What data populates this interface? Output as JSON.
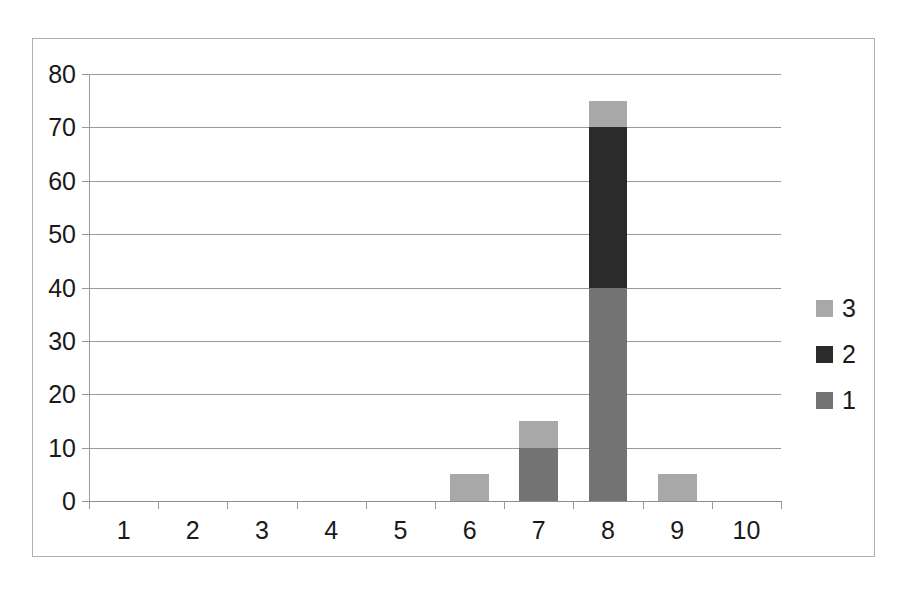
{
  "chart_data": {
    "type": "bar",
    "subtype": "stacked-column",
    "title": "",
    "subtitle": "",
    "xlabel": "",
    "ylabel": "",
    "categories": [
      "1",
      "2",
      "3",
      "4",
      "5",
      "6",
      "7",
      "8",
      "9",
      "10"
    ],
    "series": [
      {
        "name": "1",
        "color": "#737373",
        "values": [
          0,
          0,
          0,
          0,
          0,
          0,
          10,
          40,
          0,
          0
        ]
      },
      {
        "name": "2",
        "color": "#2b2b2b",
        "values": [
          0,
          0,
          0,
          0,
          0,
          0,
          0,
          30,
          0,
          0
        ]
      },
      {
        "name": "3",
        "color": "#a8a8a8",
        "values": [
          0,
          0,
          0,
          0,
          0,
          5,
          5,
          5,
          5,
          0
        ]
      }
    ],
    "totals": [
      0,
      0,
      0,
      0,
      0,
      5,
      15,
      75,
      5,
      0
    ],
    "ylim": [
      0,
      80
    ],
    "ytick_step": 10,
    "yticks": [
      "80",
      "70",
      "60",
      "50",
      "40",
      "30",
      "20",
      "10",
      "0"
    ],
    "grid": true,
    "grid_axis": "y",
    "legend_position": "right",
    "legend_order": [
      "3",
      "2",
      "1"
    ],
    "frame": true
  },
  "colors": {
    "series_1": "#737373",
    "series_2": "#2b2b2b",
    "series_3": "#a8a8a8",
    "gridline": "#9a9a9a",
    "frame_border": "#b0b0b0",
    "text": "#1a1a1a",
    "background": "#ffffff"
  },
  "legend": {
    "items": [
      {
        "label": "3",
        "color": "#a8a8a8"
      },
      {
        "label": "2",
        "color": "#2b2b2b"
      },
      {
        "label": "1",
        "color": "#737373"
      }
    ]
  }
}
